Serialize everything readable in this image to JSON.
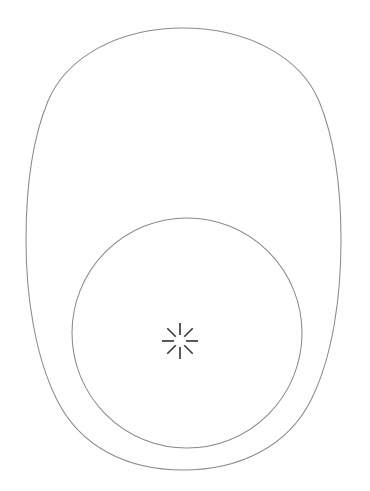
{
  "canvas": {
    "width": 370,
    "height": 491,
    "background_color": "#ffffff",
    "title": "Shape Outline Canvas"
  },
  "style": {
    "outline_stroke_color": "#8a8a8a",
    "outline_stroke_width": 1.05,
    "burst_stroke_color": "#3b3b3b",
    "burst_stroke_width": 1.7
  },
  "shapes": {
    "outer_oval": {
      "name": "outer-egg-outline",
      "description": "large rounded egg-shaped outline",
      "bounds": {
        "left": 26,
        "top": 28,
        "right": 341,
        "bottom": 470
      },
      "width": 315,
      "height": 442,
      "center": {
        "x": 183,
        "y": 249
      },
      "path": "M 183 28 C 246 28 300 56 319 101 C 336 142 341 196 341 240 C 341 296 333 356 311 400 C 288 446 240 470 183 470 C 126 470 80 446 57 400 C 35 356 26 296 26 240 C 26 196 31 142 48 101 C 67 56 120 28 183 28 Z"
    },
    "inner_circle": {
      "name": "inner-circle-outline",
      "description": "circle overlapping the lower portion of the egg shape",
      "center": {
        "x": 187,
        "y": 333
      },
      "radius": 115,
      "bounds": {
        "left": 72,
        "top": 218,
        "right": 302,
        "bottom": 448
      }
    },
    "center_burst": {
      "name": "burst-icon",
      "description": "eight-spoke radial burst with hollow center",
      "center": {
        "x": 180,
        "y": 341
      },
      "spoke_count": 8,
      "inner_radius": 6,
      "outer_radius": 18,
      "angles_deg": [
        0,
        45,
        90,
        135,
        180,
        225,
        270,
        315
      ]
    }
  },
  "intersections": [
    {
      "name": "left-crossing",
      "x": 92,
      "y": 423
    },
    {
      "name": "right-crossing",
      "x": 275,
      "y": 420
    }
  ]
}
